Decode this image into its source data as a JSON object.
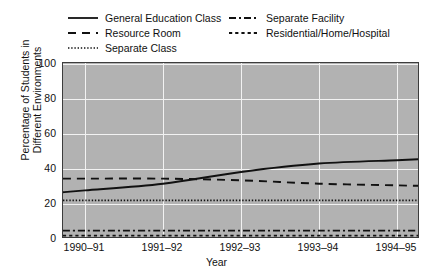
{
  "chart_data": {
    "type": "line",
    "title": "",
    "xlabel": "Year",
    "ylabel_line1": "Percentage of Students in",
    "ylabel_line2": "Different Environments",
    "categories": [
      "1990–91",
      "1991–92",
      "1992–93",
      "1993–94",
      "1994–95"
    ],
    "x_tick_labels": [
      "1990–91",
      "1991–92",
      "1992–93",
      "1993–94",
      "1994–95"
    ],
    "y_tick_labels": [
      "0",
      "20",
      "40",
      "60",
      "80",
      "100"
    ],
    "y_ticks": [
      0,
      20,
      40,
      60,
      80,
      100
    ],
    "ylim": [
      0,
      105
    ],
    "grid": true,
    "legend_position": "above-plot",
    "plot_background": "#b2b2b2",
    "gridline_color": "#f2f2f2",
    "line_color": "#111111",
    "series": [
      {
        "name": "General Education Class",
        "style": "solid",
        "values": [
          29,
          33,
          40,
          45,
          47
        ]
      },
      {
        "name": "Resource Room",
        "style": "dashed",
        "values": [
          36,
          36,
          35,
          33,
          32
        ]
      },
      {
        "name": "Separate Class",
        "style": "dotted",
        "values": [
          23,
          23,
          23,
          23,
          23
        ]
      },
      {
        "name": "Separate Facility",
        "style": "dash-dot",
        "values": [
          5,
          5,
          5,
          5,
          5
        ]
      },
      {
        "name": "Residential/Home/Hospital",
        "style": "short-dashed",
        "values": [
          2,
          2,
          2,
          2,
          2
        ]
      }
    ]
  },
  "legend": {
    "entries": [
      {
        "label": "General Education Class",
        "style": "solid"
      },
      {
        "label": "Resource Room",
        "style": "dashed"
      },
      {
        "label": "Separate Class",
        "style": "dotted"
      },
      {
        "label": "Separate Facility",
        "style": "dash-dot"
      },
      {
        "label": "Residential/Home/Hospital",
        "style": "short-dashed"
      }
    ]
  }
}
